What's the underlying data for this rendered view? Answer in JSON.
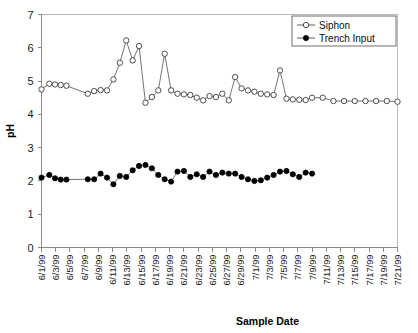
{
  "chart_data": {
    "type": "line",
    "title": "",
    "xlabel": "Sample Date",
    "ylabel": "pH",
    "ylim": [
      0,
      7
    ],
    "ytick_labels": [
      "0",
      "1",
      "2",
      "3",
      "4",
      "5",
      "6",
      "7"
    ],
    "grid": false,
    "legend_position": "top-right",
    "xtick_labels": [
      "6/1/99",
      "6/3/99",
      "6/5/99",
      "6/7/99",
      "6/9/99",
      "6/11/99",
      "6/13/99",
      "6/15/99",
      "6/17/99",
      "6/19/99",
      "6/21/99",
      "6/23/99",
      "6/25/99",
      "6/27/99",
      "6/29/99",
      "7/1/99",
      "7/3/99",
      "7/5/99",
      "7/7/99",
      "7/9/99",
      "7/11/99",
      "7/13/99",
      "7/15/99",
      "7/17/99",
      "7/19/99",
      "7/21/99"
    ],
    "series": [
      {
        "name": "Siphon",
        "marker": "open-circle",
        "x": [
          0.0,
          1.1,
          1.9,
          2.7,
          3.5,
          6.5,
          7.4,
          8.3,
          9.2,
          10.1,
          11.0,
          11.9,
          12.8,
          13.7,
          14.6,
          15.5,
          16.4,
          17.3,
          18.2,
          19.1,
          20.0,
          20.9,
          21.8,
          22.7,
          23.6,
          24.5,
          25.4,
          26.3,
          27.2,
          28.1,
          29.0,
          29.9,
          30.8,
          31.7,
          32.6,
          33.5,
          34.4,
          35.3,
          36.2,
          37.1,
          38.0,
          39.5,
          41.0,
          42.5,
          44.0,
          45.5,
          47.0,
          48.5,
          50.0
        ],
        "values": [
          4.75,
          4.92,
          4.9,
          4.88,
          4.86,
          4.62,
          4.7,
          4.73,
          4.72,
          5.05,
          5.55,
          6.22,
          5.62,
          6.05,
          4.35,
          4.52,
          4.72,
          5.82,
          4.72,
          4.62,
          4.6,
          4.58,
          4.5,
          4.42,
          4.55,
          4.52,
          4.62,
          4.42,
          5.12,
          4.78,
          4.72,
          4.68,
          4.62,
          4.6,
          4.58,
          5.32,
          4.47,
          4.45,
          4.44,
          4.43,
          4.5,
          4.5,
          4.4,
          4.4,
          4.4,
          4.4,
          4.4,
          4.4,
          4.38
        ]
      },
      {
        "name": "Trench Input",
        "marker": "filled-circle",
        "x": [
          0.0,
          1.1,
          1.9,
          2.7,
          3.5,
          6.5,
          7.4,
          8.3,
          9.2,
          10.1,
          11.0,
          11.9,
          12.8,
          13.7,
          14.6,
          15.5,
          16.4,
          17.3,
          18.2,
          19.1,
          20.0,
          20.9,
          21.8,
          22.7,
          23.6,
          24.5,
          25.4,
          26.3,
          27.2,
          28.1,
          29.0,
          29.9,
          30.8,
          31.7,
          32.6,
          33.5,
          34.4,
          35.3,
          36.2,
          37.1,
          38.0
        ],
        "values": [
          2.1,
          2.18,
          2.08,
          2.04,
          2.04,
          2.05,
          2.05,
          2.22,
          2.1,
          1.9,
          2.15,
          2.12,
          2.32,
          2.45,
          2.48,
          2.38,
          2.18,
          2.05,
          1.98,
          2.28,
          2.3,
          2.12,
          2.2,
          2.12,
          2.28,
          2.18,
          2.25,
          2.22,
          2.22,
          2.12,
          2.05,
          2.0,
          2.02,
          2.1,
          2.18,
          2.28,
          2.3,
          2.2,
          2.12,
          2.25,
          2.22
        ]
      }
    ]
  },
  "legend": {
    "entries": [
      {
        "label": "Siphon"
      },
      {
        "label": "Trench Input"
      }
    ]
  },
  "colors": {
    "line": "#5a5a5a",
    "marker_open_fill": "#ffffff",
    "marker_filled_fill": "#000000",
    "axis": "#8a8a8a",
    "text": "#1a1a1a"
  }
}
